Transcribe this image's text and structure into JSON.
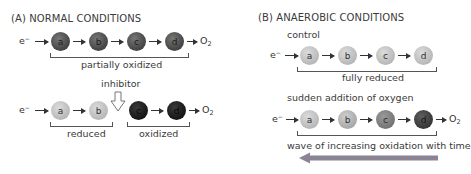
{
  "panel_a": {
    "title": "(A)  NORMAL CONDITIONS",
    "row1": {
      "electron": "e",
      "electron_sup": "−",
      "carriers": [
        "a",
        "b",
        "c",
        "d"
      ],
      "end": "O",
      "end_sub": "2",
      "state": "partially oxidized"
    },
    "inhibitor_label": "inhibitor",
    "row2": {
      "electron": "e",
      "electron_sup": "−",
      "carriers": [
        "a",
        "b",
        "c",
        "d"
      ],
      "end": "O",
      "end_sub": "2",
      "left_state": "reduced",
      "right_state": "oxidized"
    }
  },
  "panel_b": {
    "title": "(B)  ANAEROBIC CONDITIONS",
    "control_label": "control",
    "row1": {
      "electron": "e",
      "electron_sup": "−",
      "carriers": [
        "a",
        "b",
        "c",
        "d"
      ],
      "state": "fully reduced"
    },
    "oxygen_label": "sudden addition of oxygen",
    "row2": {
      "electron": "e",
      "electron_sup": "−",
      "carriers": [
        "a",
        "b",
        "c",
        "d"
      ],
      "end": "O",
      "end_sub": "2"
    },
    "wave_label": "wave of increasing oxidation with time"
  },
  "colors": {
    "wave_arrow": "#8a8494",
    "text": "#3a3a3a"
  }
}
